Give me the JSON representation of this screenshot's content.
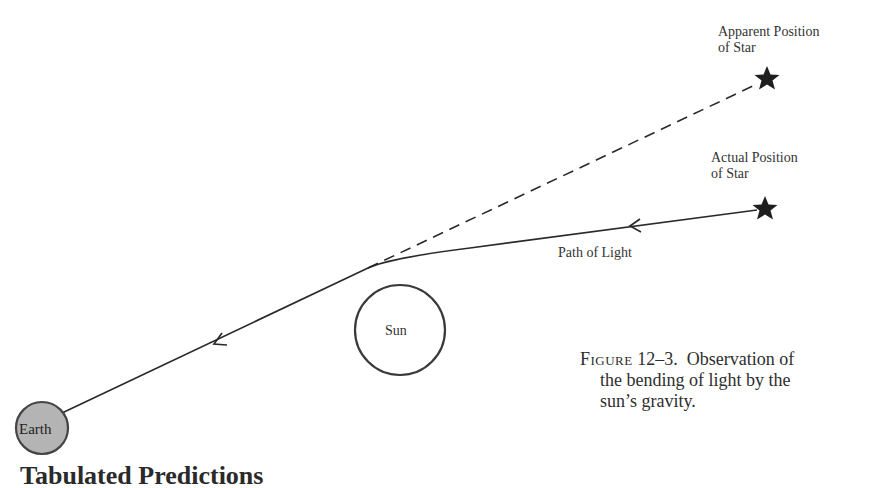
{
  "figure": {
    "labels": {
      "apparent_position": [
        "Apparent Position",
        "of Star"
      ],
      "actual_position": [
        "Actual Position",
        "of Star"
      ],
      "path_of_light": "Path of Light",
      "sun": "Sun",
      "earth": "Earth"
    },
    "caption": {
      "figure_word": "Figure",
      "figure_number": "12–3.",
      "line1_text": "Observation of",
      "line2": "the bending of light by the",
      "line3": "sun’s gravity."
    },
    "colors": {
      "line": "#2a2a2a",
      "earth_fill": "#b4b4b4",
      "star": "#1e1e1e"
    }
  },
  "bottom_heading": "Tabulated Predictions"
}
